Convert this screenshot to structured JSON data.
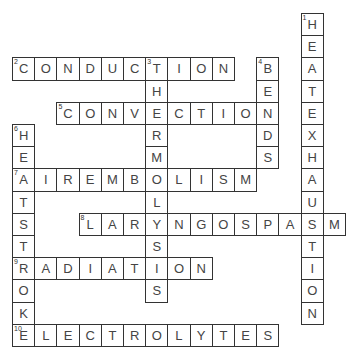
{
  "puzzle": {
    "type": "crossword",
    "cell_size": 22.2,
    "origin": {
      "x": 12,
      "y": 13
    },
    "entries": [
      {
        "number": "1",
        "direction": "down",
        "answer": "HEATEXHAUSTION",
        "col": 13,
        "row": 0
      },
      {
        "number": "2",
        "direction": "across",
        "answer": "CONDUCTION",
        "col": 0,
        "row": 2
      },
      {
        "number": "3",
        "direction": "down",
        "answer": "THERMOLYSIS",
        "col": 6,
        "row": 2
      },
      {
        "number": "4",
        "direction": "down",
        "answer": "BENDS",
        "col": 11,
        "row": 2
      },
      {
        "number": "5",
        "direction": "across",
        "answer": "CONVECTION",
        "col": 2,
        "row": 4
      },
      {
        "number": "6",
        "direction": "down",
        "answer": "HEATSTROKE",
        "col": 0,
        "row": 5
      },
      {
        "number": "7",
        "direction": "across",
        "answer": "AIREMBOLISM",
        "col": 0,
        "row": 7
      },
      {
        "number": "8",
        "direction": "across",
        "answer": "LARYNGOSPASM",
        "col": 3,
        "row": 9
      },
      {
        "number": "9",
        "direction": "across",
        "answer": "RADIATION",
        "col": 0,
        "row": 11
      },
      {
        "number": "10",
        "direction": "across",
        "answer": "ELECTROLYTES",
        "col": 0,
        "row": 14
      }
    ]
  }
}
